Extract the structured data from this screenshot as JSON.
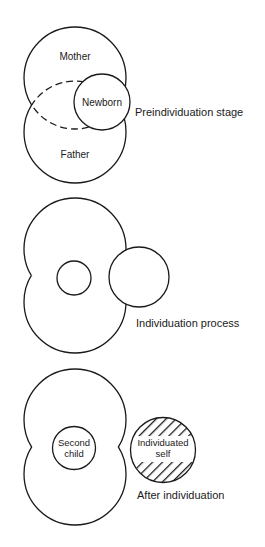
{
  "diagram": {
    "colors": {
      "line": "#1a1a1a",
      "background": "#ffffff"
    },
    "stages": [
      {
        "id": "preindividuation",
        "caption": "Preindividuation stage",
        "circles": {
          "mother": "Mother",
          "father": "Father",
          "newborn": "Newborn"
        }
      },
      {
        "id": "individuation",
        "caption": "Individuation process"
      },
      {
        "id": "after",
        "caption": "After individuation",
        "circles": {
          "second_child_line1": "Second",
          "second_child_line2": "child",
          "self_line1": "Individuated",
          "self_line2": "self"
        }
      }
    ]
  }
}
